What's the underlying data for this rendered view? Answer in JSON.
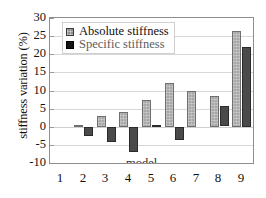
{
  "chart_data": {
    "type": "bar",
    "title": "",
    "xlabel": "model",
    "ylabel": "stiffness variation (%)",
    "categories": [
      "1",
      "2",
      "3",
      "4",
      "5",
      "6",
      "7",
      "8",
      "9"
    ],
    "ylim": [
      -10,
      30
    ],
    "ytick_values": [
      30,
      25,
      20,
      15,
      10,
      5,
      0,
      -5,
      -10
    ],
    "ytick_labels": [
      "30",
      "25",
      "20",
      "15",
      "10",
      "5",
      "0",
      "-5",
      "-10"
    ],
    "grid": true,
    "legend_position": "top-left",
    "series": [
      {
        "name": "Absolute stiffness",
        "color": "#a8a8a8",
        "values": [
          0,
          0.5,
          3.0,
          4.0,
          7.5,
          12.2,
          10.0,
          8.6,
          26.5
        ]
      },
      {
        "name": "Specific stiffness",
        "color": "#4a4a4a",
        "values": [
          0,
          -2.6,
          -4.2,
          -7.0,
          0.5,
          -3.6,
          0.1,
          5.6,
          22.0
        ]
      }
    ]
  },
  "legend": {
    "items": [
      {
        "label": "Absolute stiffness",
        "swatch": "abs"
      },
      {
        "label": "Specific stiffness",
        "swatch": "spec"
      }
    ]
  },
  "axes": {
    "y_title": "stiffness variation (%)",
    "x_title_inner": "model"
  }
}
